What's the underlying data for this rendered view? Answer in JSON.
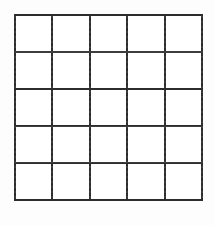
{
  "figure": {
    "name": "blank-grid",
    "kind": "grid",
    "rows": 5,
    "columns": 5,
    "total_cells": 25,
    "cells_filled": 0,
    "cell_contents": [
      [
        "",
        "",
        "",
        "",
        ""
      ],
      [
        "",
        "",
        "",
        "",
        ""
      ],
      [
        "",
        "",
        "",
        "",
        ""
      ],
      [
        "",
        "",
        "",
        "",
        ""
      ],
      [
        "",
        "",
        "",
        "",
        ""
      ]
    ],
    "geometry": {
      "left_px": 14,
      "top_px": 14,
      "width_px": 189,
      "height_px": 187,
      "line_width_px": 2
    },
    "colors": {
      "line": "#2c2c2c",
      "cell_fill": "#ffffff",
      "page_background": "#fdfdfd"
    }
  },
  "canvas": {
    "width_px": 214,
    "height_px": 225
  }
}
